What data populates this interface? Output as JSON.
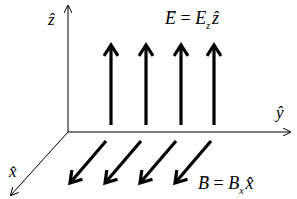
{
  "diagram": {
    "axes": {
      "z": {
        "label": "ẑ"
      },
      "y": {
        "label": "ŷ"
      },
      "x": {
        "label": "x̂"
      }
    },
    "electric_field": {
      "label": "E⃗ = E_z ẑ",
      "lhs": "E",
      "rhs_base": "E",
      "rhs_sub": "z",
      "unit": "ẑ",
      "arrow_count": 4,
      "direction": "+z"
    },
    "magnetic_field": {
      "label": "B⃗ = B_x x̂",
      "lhs": "B",
      "rhs_base": "B",
      "rhs_sub": "x",
      "unit": "x̂",
      "arrow_count": 4,
      "direction": "+x"
    },
    "colors": {
      "ink": "#000000",
      "background": "#ffffff"
    }
  }
}
